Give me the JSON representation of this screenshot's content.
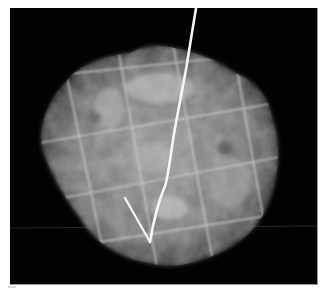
{
  "image": {
    "kind": "specimen radiograph",
    "description": "Grayscale X-ray of a roughly circular tissue specimen overlaid with a grid of faint white lines and a bright localization hook wire.",
    "colors": {
      "background": "#020202",
      "tissue": "#8a8a8a",
      "grid": "#d0d0d0",
      "wire": "#f4f4f4"
    },
    "elements": {
      "specimen": "tissue-specimen",
      "grid": "grid-lines",
      "wire": "hook-wire"
    }
  }
}
